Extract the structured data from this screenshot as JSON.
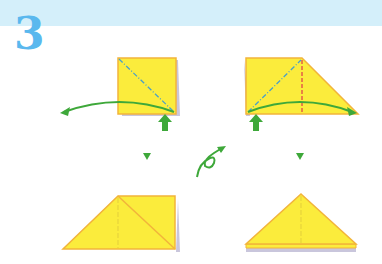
{
  "header": {
    "step_number": "3",
    "band_color": "#d4effa",
    "step_color": "#5ab8ee"
  },
  "colors": {
    "paper_fill": "#fbec3c",
    "paper_edge": "#f2b43a",
    "paper_back": "#c9c6dc",
    "valley_line": "#4aa0c8",
    "mountain_line": "#e04848",
    "arrow": "#3ea83a"
  },
  "steps": [
    {
      "id": "a",
      "shape": "square",
      "fold": "valley-diagonal",
      "arrow": "fold-left",
      "push": "up-arrow"
    },
    {
      "id": "b",
      "shape": "trapezoid",
      "fold": "valley-diagonal + mountain-vertical",
      "arrow": "fold-right",
      "push": "up-arrow"
    },
    {
      "id": "c",
      "shape": "folded-trapezoid"
    },
    {
      "id": "d",
      "shape": "triangle"
    }
  ],
  "icons": [
    "down-triangle-icon",
    "flip-over-icon",
    "down-triangle-icon"
  ]
}
